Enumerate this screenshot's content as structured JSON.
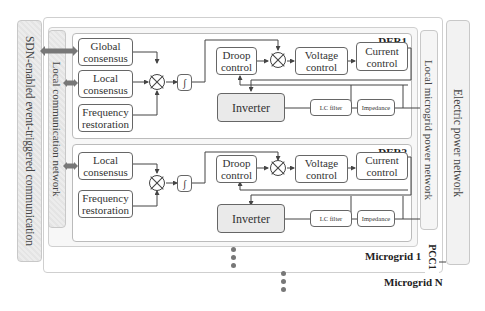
{
  "diagram": {
    "left_bars": {
      "sdn": "SDN-enabled event-triggered communication",
      "local_comm": "Local communication network"
    },
    "right_bars": {
      "local_power": "Local microgrid power network",
      "electric_power": "Electric power network"
    },
    "der1": {
      "title": "DER1",
      "blocks": {
        "global_consensus": "Global consensus",
        "local_consensus": "Local consensus",
        "frequency_restoration": "Frequency restoration",
        "integrator": "∫",
        "droop_control": "Droop control",
        "voltage_control": "Voltage control",
        "current_control": "Current control",
        "inverter": "Inverter",
        "lc_filter": "LC filter",
        "impedance": "Impedance"
      }
    },
    "der2": {
      "title": "DER2",
      "blocks": {
        "local_consensus": "Local consensus",
        "frequency_restoration": "Frequency restoration",
        "integrator": "∫",
        "droop_control": "Droop control",
        "voltage_control": "Voltage control",
        "current_control": "Current control",
        "inverter": "Inverter",
        "lc_filter": "LC filter",
        "impedance": "Impedance"
      }
    },
    "microgrid1_label": "Microgrid 1",
    "microgridN_label": "Microgrid N",
    "pcc_label": "PCC1",
    "colors": {
      "border": "#666666",
      "panel": "#cfcfcf",
      "inverter_fill": "#eaeaea",
      "arrow": "#777777"
    }
  }
}
